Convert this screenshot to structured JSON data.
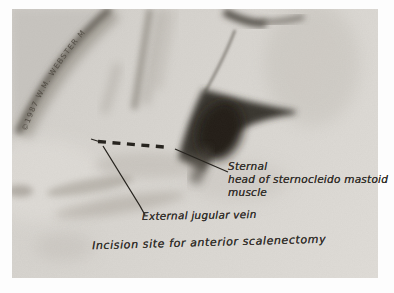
{
  "figure": {
    "type": "hand-drawn anatomical illustration of neck and shoulder",
    "copyright_text": "©1987 W.M. WEBSTER M",
    "annotations": {
      "sternal": {
        "line1": "Sternal",
        "line2": "head of sternocleido mastoid",
        "line3": "muscle"
      },
      "external_jugular": "External jugular vein",
      "caption": "Incision site for anterior scalenectomy"
    },
    "markers": {
      "incision_line_style": "thick black dashes"
    },
    "colors": {
      "page_margin": "#fdfdfd",
      "paper": "#d8d5d0",
      "ink": "#34312c",
      "pencil_dark": "#25221d",
      "pencil_mid": "#8a857c"
    }
  }
}
